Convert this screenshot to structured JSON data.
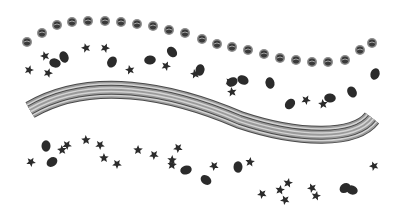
{
  "scene": {
    "description": "Grayscale decorative illustration: arc of round dots, scattered leaves, and a striped S-curved ribbon",
    "colors": {
      "background": "#ffffff",
      "dot_fill": "#3a3a3a",
      "dot_ring": "#8c8c8c",
      "leaf": "#2b2b2b",
      "ribbon_dark": "#4a4a4a",
      "ribbon_mid": "#9a9a9a",
      "ribbon_light": "#d4d4d4"
    },
    "dots": [
      [
        27,
        42
      ],
      [
        42,
        33
      ],
      [
        57,
        25
      ],
      [
        72,
        22
      ],
      [
        88,
        21
      ],
      [
        105,
        21
      ],
      [
        121,
        22
      ],
      [
        137,
        24
      ],
      [
        153,
        26
      ],
      [
        169,
        30
      ],
      [
        185,
        33
      ],
      [
        202,
        39
      ],
      [
        217,
        44
      ],
      [
        232,
        47
      ],
      [
        248,
        50
      ],
      [
        264,
        54
      ],
      [
        280,
        58
      ],
      [
        296,
        60
      ],
      [
        312,
        62
      ],
      [
        328,
        62
      ],
      [
        345,
        60
      ],
      [
        360,
        50
      ],
      [
        372,
        43
      ]
    ],
    "maple_leaves": [
      [
        29,
        70
      ],
      [
        45,
        56
      ],
      [
        48,
        73
      ],
      [
        86,
        48
      ],
      [
        105,
        48
      ],
      [
        130,
        70
      ],
      [
        166,
        66
      ],
      [
        195,
        74
      ],
      [
        230,
        82
      ],
      [
        232,
        92
      ],
      [
        306,
        100
      ],
      [
        323,
        104
      ],
      [
        31,
        162
      ],
      [
        62,
        150
      ],
      [
        67,
        145
      ],
      [
        86,
        140
      ],
      [
        100,
        145
      ],
      [
        104,
        158
      ],
      [
        117,
        164
      ],
      [
        138,
        150
      ],
      [
        154,
        155
      ],
      [
        172,
        160
      ],
      [
        178,
        148
      ],
      [
        172,
        165
      ],
      [
        214,
        166
      ],
      [
        250,
        162
      ],
      [
        262,
        194
      ],
      [
        280,
        190
      ],
      [
        285,
        200
      ],
      [
        288,
        183
      ],
      [
        312,
        188
      ],
      [
        316,
        196
      ],
      [
        374,
        166
      ]
    ],
    "round_leaves": [
      [
        46,
        146
      ],
      [
        52,
        162
      ],
      [
        55,
        63
      ],
      [
        64,
        57
      ],
      [
        112,
        62
      ],
      [
        150,
        60
      ],
      [
        172,
        52
      ],
      [
        200,
        70
      ],
      [
        232,
        82
      ],
      [
        243,
        80
      ],
      [
        270,
        83
      ],
      [
        290,
        104
      ],
      [
        330,
        98
      ],
      [
        352,
        92
      ],
      [
        375,
        74
      ],
      [
        186,
        170
      ],
      [
        206,
        180
      ],
      [
        238,
        167
      ],
      [
        345,
        188
      ],
      [
        352,
        190
      ]
    ],
    "ribbon": {
      "path": "M30,110 C90,75 170,90 240,120 C300,140 355,140 372,118",
      "width": 18
    }
  }
}
